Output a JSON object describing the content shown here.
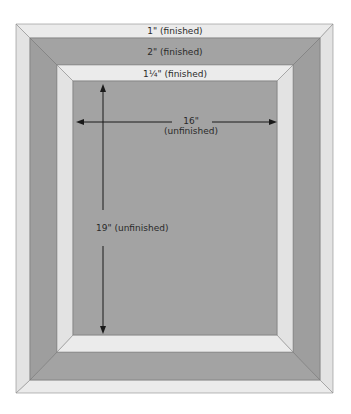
{
  "diagram": {
    "borders": [
      {
        "name": "outer-border",
        "label": "1\" (finished)",
        "color": "#e6e6e6"
      },
      {
        "name": "middle-border",
        "label": "2\" (finished)",
        "color": "#a3a3a3"
      },
      {
        "name": "inner-border",
        "label": "1¼\" (finished)",
        "color": "#e6e6e6"
      }
    ],
    "center": {
      "color": "#a3a3a3",
      "width_label_line1": "16\"",
      "width_label_line2": "(unfinished)",
      "height_label": "19\" (unfinished)"
    },
    "colors": {
      "light": "#e6e6e6",
      "dark": "#a3a3a3",
      "line": "#8c8c8c",
      "arrow": "#1a1a1a"
    }
  }
}
